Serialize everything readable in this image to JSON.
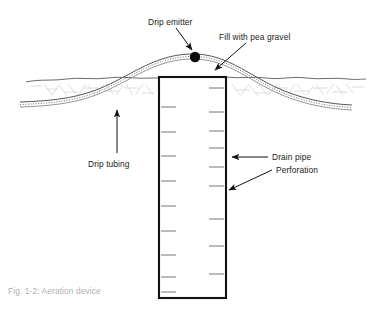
{
  "figure": {
    "caption": "Fig. 1-2: Aeration device",
    "background_color": "#ffffff",
    "line_color": "#1a1a1a",
    "soil_color": "#c9c9c9",
    "caption_color": "#b0b0b0"
  },
  "labels": {
    "drip_emitter": "Drip emitter",
    "fill_with_pea_gravel": "Fill with pea gravel",
    "drip_tubing": "Drip tubing",
    "drain_pipe": "Drain pipe",
    "perforation": "Perforation"
  },
  "diagram": {
    "components": [
      {
        "name": "drip-emitter",
        "label": "Drip emitter",
        "shape": "filled-circle",
        "position": {
          "x": 195,
          "y": 57
        },
        "radius": 5
      },
      {
        "name": "drip-tubing",
        "label": "Drip tubing",
        "shape": "double-line-arc",
        "description": "Tubing arcs over the pipe and descends on both sides below grade"
      },
      {
        "name": "drain-pipe",
        "label": "Drain pipe",
        "shape": "rectangle",
        "position": {
          "x": 159,
          "y": 77
        },
        "width": 67,
        "height": 221
      },
      {
        "name": "perforation",
        "label": "Perforation",
        "shape": "tick-marks",
        "count_left": 9,
        "count_right": 9,
        "description": "Staggered horizontal slits on both inner walls of the drain pipe"
      },
      {
        "name": "ground-line",
        "label": "Ground surface",
        "shape": "irregular-horizontal-line",
        "position": {
          "y": 78
        }
      },
      {
        "name": "pea-gravel-fill",
        "label": "Fill with pea gravel",
        "shape": "arrow-annotation",
        "target": {
          "x": 213,
          "y": 74
        }
      }
    ]
  },
  "leaders": {
    "drip_emitter_arrow": "points down-right to emitter dot",
    "pea_gravel_arrow": "points down-left to pipe top",
    "drip_tubing_arrow": "points up to tubing",
    "drain_pipe_arrow": "points left to pipe wall",
    "perforation_arrow": "points down-left to a perforation tick"
  }
}
